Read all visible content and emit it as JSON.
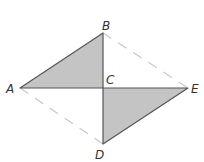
{
  "diagram": {
    "type": "geometry",
    "points": {
      "A": {
        "label": "A",
        "x": 20,
        "y": 88
      },
      "B": {
        "label": "B",
        "x": 103,
        "y": 33
      },
      "C": {
        "label": "C",
        "x": 103,
        "y": 88
      },
      "D": {
        "label": "D",
        "x": 103,
        "y": 144
      },
      "E": {
        "label": "E",
        "x": 188,
        "y": 88
      }
    },
    "shaded_triangles": [
      {
        "name": "triangle-ABC",
        "vertices": [
          "A",
          "B",
          "C"
        ]
      },
      {
        "name": "triangle-DCE",
        "vertices": [
          "D",
          "C",
          "E"
        ]
      }
    ],
    "dashed_segments": [
      {
        "name": "segment-BE",
        "from": "B",
        "to": "E"
      },
      {
        "name": "segment-AD",
        "from": "A",
        "to": "D"
      }
    ],
    "colors": {
      "fill": "#c4c4c4",
      "stroke": "#555555",
      "dashed": "#c8c8c8",
      "label": "#333333"
    }
  }
}
